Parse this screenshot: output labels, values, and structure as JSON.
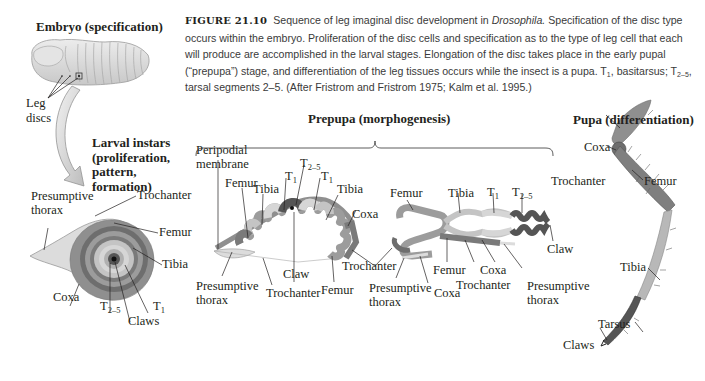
{
  "caption": {
    "figure_number": "FIGURE 21.10",
    "text_part1": "Sequence of leg imaginal disc development in ",
    "organism": "Drosophila.",
    "text_part2": " Specification of the disc type occurs within the embryo. Proliferation of the disc cells and specification as to the type of leg cell that each will produce are accomplished in the larval stages. Elongation of the disc takes place in the early pupal (“prepupa”) stage, and differentiation of the leg tissues occurs while the insect is a pupa. T",
    "t1_sub": "1",
    "text_part3": ", basitarsus; T",
    "t25_sub": "2–5",
    "text_part4": ", tarsal segments 2–5. (After Fristrom and Fristrom 1975; Kalm et al. 1995.)"
  },
  "stages": {
    "embryo": {
      "title": "Embryo (specification)",
      "labels": {
        "leg_discs_1": "Leg",
        "leg_discs_2": "discs"
      }
    },
    "larval": {
      "title_lines": [
        "Larval instars",
        "(proliferation,",
        "pattern,",
        "formation)"
      ],
      "labels": {
        "presumptive_thorax_1": "Presumptive",
        "presumptive_thorax_2": "thorax",
        "trochanter": "Trochanter",
        "femur": "Femur",
        "tibia": "Tibia",
        "coxa": "Coxa",
        "t25": "T",
        "t25_sub": "2–5",
        "claws": "Claws",
        "t1": "T",
        "t1_sub": "1"
      }
    },
    "prepupa": {
      "title": "Prepupa (morphogenesis)",
      "labels": {
        "peripodial_1": "Peripodial",
        "peripodial_2": "membrane",
        "femur_a": "Femur",
        "tibia_a": "Tibia",
        "t1_a": "T",
        "t1_a_sub": "1",
        "t25_a": "T",
        "t25_a_sub": "2–5",
        "t1_b": "T",
        "t1_b_sub": "1",
        "tibia_b": "Tibia",
        "coxa_a": "Coxa",
        "claw_a": "Claw",
        "presumptive_a_1": "Presumptive",
        "presumptive_a_2": "thorax",
        "trochanter_a": "Trochanter",
        "femur_b": "Femur",
        "trochanter_b": "Trochanter",
        "femur_c": "Femur",
        "tibia_c": "Tibia",
        "t1_c": "T",
        "t1_c_sub": "1",
        "t25_c": "T",
        "t25_c_sub": "2–5",
        "claw_b": "Claw",
        "femur_d": "Femur",
        "presumptive_b_1": "Presumptive",
        "presumptive_b_2": "thorax",
        "coxa_b": "Coxa",
        "femur_e": "Femur",
        "coxa_c": "Coxa",
        "trochanter_c": "Trochanter",
        "presumptive_c_1": "Presumptive",
        "presumptive_c_2": "thorax"
      }
    },
    "pupa": {
      "title": "Pupa (differentiation)",
      "labels": {
        "coxa": "Coxa",
        "trochanter": "Trochanter",
        "femur": "Femur",
        "tibia": "Tibia",
        "tarsus": "Tarsus",
        "claws": "Claws"
      }
    }
  },
  "colors": {
    "coxa": "#8f8f8f",
    "trochanter": "#6e6e6e",
    "femur": "#9c9c9c",
    "tibia": "#c4c4c4",
    "t1": "#d6d6d6",
    "t25": "#555555",
    "thorax": "#dcdcdc",
    "body": "#d9d9d9"
  }
}
